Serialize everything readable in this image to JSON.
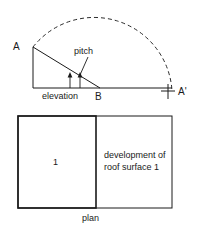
{
  "figure": {
    "type": "technical-drawing",
    "background_color": "#ffffff",
    "line_color": "#1a1a1a"
  },
  "elevation": {
    "caption": "elevation",
    "vertex_a_label": "A",
    "vertex_b_label": "B",
    "pitch_label": "pitch",
    "geometry": {
      "vertex_a": [
        33,
        47
      ],
      "vertex_b": [
        100,
        88
      ],
      "vertex_corner": [
        33,
        88
      ],
      "base_extends_to_x": 172
    }
  },
  "arc": {
    "description": "dashed swing arc from A about B to A prime",
    "center": [
      100,
      88
    ],
    "radius": 78,
    "style": "dashed",
    "endpoint_label": "A'",
    "endpoint_marker": "cross-tick",
    "endpoint_position": [
      168,
      91
    ]
  },
  "plan": {
    "caption": "plan",
    "surface_number": "1",
    "development_label_line1": "development of",
    "development_label_line2": "roof surface 1",
    "geometry": {
      "outer_left": 18,
      "outer_top": 116,
      "divider_x": 96,
      "outer_right": 172,
      "outer_bottom": 208
    }
  }
}
